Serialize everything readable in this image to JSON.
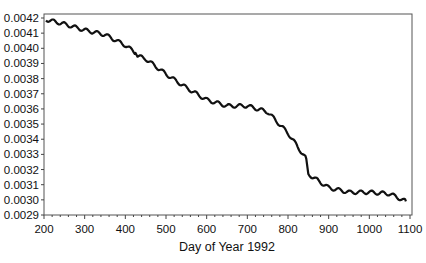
{
  "chart_data": {
    "type": "line",
    "title": "",
    "xlabel": "Day of Year 1992",
    "ylabel": "",
    "xlim": [
      200,
      1100
    ],
    "ylim": [
      0.0029,
      0.0042
    ],
    "grid": false,
    "legend": null,
    "x_ticks": [
      200,
      300,
      400,
      500,
      600,
      700,
      800,
      900,
      1000,
      1100
    ],
    "x_tick_labels": [
      "200",
      "300",
      "400",
      "500",
      "600",
      "700",
      "800",
      "900",
      "1000",
      "1100"
    ],
    "y_ticks": [
      0.0029,
      0.003,
      0.0031,
      0.0032,
      0.0033,
      0.0034,
      0.0035,
      0.0036,
      0.0037,
      0.0038,
      0.0039,
      0.004,
      0.0041,
      0.0042
    ],
    "y_tick_labels": [
      "0.0029",
      "0.0030",
      "0.0031",
      "0.0032",
      "0.0033",
      "0.0034",
      "0.0035",
      "0.0036",
      "0.0037",
      "0.0038",
      "0.0039",
      "0.0040",
      "0.0041",
      "0.0042"
    ],
    "series": [
      {
        "name": "series",
        "color": "#111111",
        "x": [
          205,
          250,
          300,
          350,
          400,
          425,
          430,
          450,
          500,
          550,
          600,
          650,
          700,
          750,
          800,
          845,
          850,
          900,
          950,
          1000,
          1050,
          1090
        ],
        "y": [
          0.00419,
          0.00416,
          0.00412,
          0.00409,
          0.00402,
          0.00397,
          0.00395,
          0.00393,
          0.00383,
          0.00374,
          0.00366,
          0.00362,
          0.00362,
          0.00358,
          0.00344,
          0.00327,
          0.00317,
          0.00308,
          0.00305,
          0.00305,
          0.00304,
          0.00299
        ]
      }
    ]
  }
}
